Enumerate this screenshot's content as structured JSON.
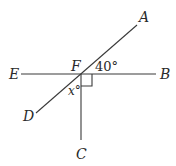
{
  "diagram": {
    "type": "geometry-angles",
    "points": {
      "A": {
        "label": "A",
        "x": 137,
        "y": 25
      },
      "B": {
        "label": "B",
        "x": 156,
        "y": 74
      },
      "C": {
        "label": "C",
        "x": 81,
        "y": 140
      },
      "D": {
        "label": "D",
        "x": 36,
        "y": 113
      },
      "E": {
        "label": "E",
        "x": 21,
        "y": 74
      },
      "F": {
        "label": "F",
        "x": 81,
        "y": 74
      }
    },
    "segments": [
      {
        "from": "E",
        "to": "B"
      },
      {
        "from": "D",
        "to": "A"
      },
      {
        "from": "F",
        "to": "C"
      }
    ],
    "angles": {
      "AFB": {
        "label": "40°",
        "value": 40
      },
      "DFC": {
        "label": "x°",
        "variable": "x"
      },
      "BFC": {
        "right_angle": true
      }
    },
    "colors": {
      "line": "#3a3a3a",
      "text": "#2a2a2a",
      "background": "#ffffff"
    }
  }
}
